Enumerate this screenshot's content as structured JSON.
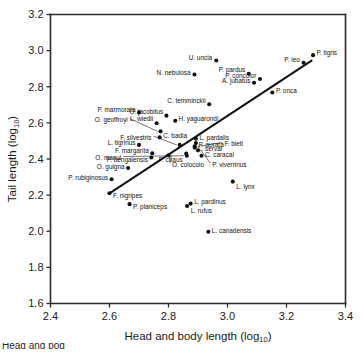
{
  "chart_data": {
    "type": "scatter",
    "title": "",
    "xlabel": "Head and body length (log",
    "xlabel_sub": "10",
    "xlabel_suffix": ")",
    "ylabel": "Tail length (log",
    "ylabel_sub": "10",
    "ylabel_suffix": ")",
    "xlim": [
      2.4,
      3.4
    ],
    "ylim": [
      1.6,
      3.2
    ],
    "xticks": [
      "2.4",
      "2.6",
      "2.8",
      "3.0",
      "3.2",
      "3.4"
    ],
    "yticks": [
      "3.2",
      "3.0",
      "2.8",
      "2.6",
      "2.4",
      "2.2",
      "2.0",
      "1.8",
      "1.6"
    ],
    "xtick_values": [
      2.4,
      2.6,
      2.8,
      3.0,
      3.2,
      3.4
    ],
    "ytick_values": [
      3.2,
      3.0,
      2.8,
      2.6,
      2.4,
      2.2,
      2.0,
      1.8,
      1.6
    ],
    "grid": false,
    "legend": "none",
    "marker_color": "#111111",
    "axis_color": "#2b2b2b",
    "fit_line": {
      "label": "regression-line",
      "x0": 2.6,
      "y0": 2.21,
      "x1": 3.285,
      "y1": 2.945,
      "color": "#111111"
    },
    "points": [
      {
        "label": "P. tigris",
        "x": 3.29,
        "y": 2.975,
        "lx": 3.302,
        "ly": 2.988,
        "anchor": "start"
      },
      {
        "label": "P. leo",
        "x": 3.258,
        "y": 2.933,
        "lx": 3.245,
        "ly": 2.948,
        "anchor": "end"
      },
      {
        "label": "U. uncia",
        "x": 2.962,
        "y": 2.945,
        "lx": 2.948,
        "ly": 2.958,
        "anchor": "end"
      },
      {
        "label": "N. nebulosa",
        "x": 2.888,
        "y": 2.868,
        "lx": 2.875,
        "ly": 2.88,
        "anchor": "end"
      },
      {
        "label": "P. pardus",
        "x": 3.072,
        "y": 2.872,
        "lx": 3.06,
        "ly": 2.892,
        "anchor": "end"
      },
      {
        "label": "P. concolor",
        "x": 3.11,
        "y": 2.843,
        "lx": 3.098,
        "ly": 2.862,
        "anchor": "end"
      },
      {
        "label": "A. jubatus",
        "x": 3.09,
        "y": 2.822,
        "lx": 3.078,
        "ly": 2.833,
        "anchor": "end"
      },
      {
        "label": "P. onca",
        "x": 3.152,
        "y": 2.768,
        "lx": 3.164,
        "ly": 2.776,
        "anchor": "start"
      },
      {
        "label": "C. temminckii",
        "x": 2.938,
        "y": 2.703,
        "lx": 2.926,
        "ly": 2.722,
        "anchor": "end"
      },
      {
        "label": "P. marmorata",
        "x": 2.7,
        "y": 2.658,
        "lx": 2.688,
        "ly": 2.67,
        "anchor": "end"
      },
      {
        "label": "O. jacobitus",
        "x": 2.793,
        "y": 2.64,
        "lx": 2.782,
        "ly": 2.662,
        "anchor": "end"
      },
      {
        "label": "H. yaguarondi",
        "x": 2.823,
        "y": 2.612,
        "lx": 2.834,
        "ly": 2.62,
        "anchor": "start"
      },
      {
        "label": "L. wiedii",
        "x": 2.76,
        "y": 2.598,
        "lx": 2.748,
        "ly": 2.622,
        "anchor": "end"
      },
      {
        "label": "O. geoffroyi",
        "x": 2.773,
        "y": 2.553,
        "lx": 2.662,
        "ly": 2.615,
        "anchor": "end",
        "leader": true
      },
      {
        "label": "C. badia",
        "x": 2.77,
        "y": 2.52,
        "lx": 2.782,
        "ly": 2.527,
        "anchor": "start"
      },
      {
        "label": "L. pardalis",
        "x": 2.893,
        "y": 2.512,
        "lx": 2.905,
        "ly": 2.52,
        "anchor": "start"
      },
      {
        "label": "F. silvestris",
        "x": 2.838,
        "y": 2.478,
        "lx": 2.742,
        "ly": 2.518,
        "anchor": "end",
        "leader": true
      },
      {
        "label": "L. tigrinus",
        "x": 2.7,
        "y": 2.478,
        "lx": 2.688,
        "ly": 2.487,
        "anchor": "end"
      },
      {
        "label": "P. aurata",
        "x": 2.893,
        "y": 2.488,
        "lx": 2.902,
        "ly": 2.48,
        "anchor": "start"
      },
      {
        "label": "F. bieti",
        "x": 2.889,
        "y": 2.47,
        "lx": 2.99,
        "ly": 2.482,
        "anchor": "start",
        "leader": true
      },
      {
        "label": "L. serval",
        "x": 2.889,
        "y": 2.463,
        "lx": 2.9,
        "ly": 2.457,
        "anchor": "start"
      },
      {
        "label": "F. margarita",
        "x": 2.745,
        "y": 2.432,
        "lx": 2.733,
        "ly": 2.447,
        "anchor": "end"
      },
      {
        "label": "P. bengalensis",
        "x": 2.742,
        "y": 2.408,
        "lx": 2.73,
        "ly": 2.398,
        "anchor": "end"
      },
      {
        "label": "O. manul",
        "x": 2.862,
        "y": 2.418,
        "lx": 2.64,
        "ly": 2.405,
        "anchor": "end",
        "leader": true
      },
      {
        "label": "F. chaus",
        "x": 2.86,
        "y": 2.43,
        "lx": 2.848,
        "ly": 2.398,
        "anchor": "end"
      },
      {
        "label": "C. caracal",
        "x": 2.912,
        "y": 2.418,
        "lx": 2.924,
        "ly": 2.425,
        "anchor": "start"
      },
      {
        "label": "O. colocolo",
        "x": 2.8,
        "y": 2.42,
        "lx": 2.812,
        "ly": 2.368,
        "anchor": "start",
        "leader": true
      },
      {
        "label": "P. viverrinus",
        "x": 2.9,
        "y": 2.448,
        "lx": 2.948,
        "ly": 2.368,
        "anchor": "start",
        "leader": true
      },
      {
        "label": "O. guigna",
        "x": 2.663,
        "y": 2.35,
        "lx": 2.651,
        "ly": 2.358,
        "anchor": "end"
      },
      {
        "label": "P. rubiginosus",
        "x": 2.607,
        "y": 2.288,
        "lx": 2.595,
        "ly": 2.297,
        "anchor": "end"
      },
      {
        "label": "L. lynx",
        "x": 3.018,
        "y": 2.275,
        "lx": 3.03,
        "ly": 2.245,
        "anchor": "start"
      },
      {
        "label": "F. nigripes",
        "x": 2.6,
        "y": 2.21,
        "lx": 2.612,
        "ly": 2.198,
        "anchor": "start"
      },
      {
        "label": "L. pardinus",
        "x": 2.875,
        "y": 2.153,
        "lx": 2.887,
        "ly": 2.163,
        "anchor": "start"
      },
      {
        "label": "P. planiceps",
        "x": 2.668,
        "y": 2.15,
        "lx": 2.68,
        "ly": 2.138,
        "anchor": "start"
      },
      {
        "label": "L. rufus",
        "x": 2.863,
        "y": 2.14,
        "lx": 2.875,
        "ly": 2.113,
        "anchor": "start"
      },
      {
        "label": "L. canadensis",
        "x": 2.935,
        "y": 1.997,
        "lx": 2.947,
        "ly": 2.003,
        "anchor": "start"
      }
    ]
  },
  "caption": {
    "text": "Head and bod"
  }
}
